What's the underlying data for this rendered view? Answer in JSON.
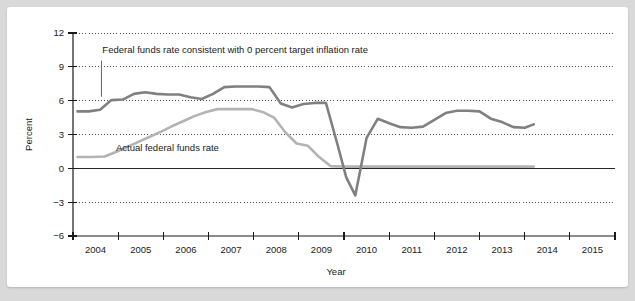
{
  "chart_data": {
    "type": "line",
    "title": "",
    "xlabel": "Year",
    "ylabel": "Percent",
    "xlim": [
      2003.5,
      2015.5
    ],
    "ylim": [
      -6,
      12
    ],
    "yticks": [
      -6,
      -3,
      0,
      3,
      6,
      9,
      12
    ],
    "ytick_labels": [
      "−6",
      "−3",
      "0",
      "3",
      "6",
      "9",
      "12"
    ],
    "xticks": [
      2003.5,
      2004.5,
      2005.5,
      2006.5,
      2007.5,
      2008.5,
      2009.5,
      2010.5,
      2011.5,
      2012.5,
      2013.5,
      2014.5,
      2015.5
    ],
    "xtick_labels": [
      "2004",
      "2005",
      "2006",
      "2007",
      "2008",
      "2009",
      "2010",
      "2011",
      "2012",
      "2013",
      "2014",
      "2015"
    ],
    "grid": "horizontal-dotted",
    "legend_position": "inline-annotations",
    "series": [
      {
        "name": "Federal funds rate consistent with 0 percent target inflation rate",
        "color": "#808080",
        "width": 2.6,
        "x": [
          2003.6,
          2003.85,
          2004.1,
          2004.35,
          2004.6,
          2004.85,
          2005.1,
          2005.35,
          2005.6,
          2005.85,
          2006.1,
          2006.35,
          2006.6,
          2006.85,
          2007.1,
          2007.35,
          2007.6,
          2007.85,
          2008.1,
          2008.35,
          2008.6,
          2008.85,
          2009.1,
          2009.35,
          2009.55,
          2009.75,
          2010.0,
          2010.25,
          2010.5,
          2010.75,
          2011.0,
          2011.25,
          2011.5,
          2011.75,
          2012.0,
          2012.25,
          2012.5,
          2012.75,
          2013.0,
          2013.25,
          2013.5,
          2013.7
        ],
        "y": [
          5.05,
          5.05,
          5.2,
          6.05,
          6.1,
          6.6,
          6.75,
          6.6,
          6.55,
          6.55,
          6.3,
          6.15,
          6.6,
          7.2,
          7.25,
          7.25,
          7.25,
          7.2,
          5.75,
          5.4,
          5.7,
          5.8,
          5.8,
          2.2,
          -0.8,
          -2.4,
          2.7,
          4.4,
          4.0,
          3.65,
          3.6,
          3.7,
          4.3,
          4.9,
          5.1,
          5.1,
          5.05,
          4.4,
          4.1,
          3.65,
          3.6,
          3.9
        ]
      },
      {
        "name": "Actual federal funds rate",
        "color": "#b3b3b3",
        "width": 2.6,
        "x": [
          2003.6,
          2003.9,
          2004.2,
          2004.45,
          2004.7,
          2004.95,
          2005.2,
          2005.45,
          2005.7,
          2005.95,
          2006.2,
          2006.45,
          2006.7,
          2006.95,
          2007.2,
          2007.45,
          2007.7,
          2007.95,
          2008.2,
          2008.45,
          2008.7,
          2008.95,
          2009.2,
          2009.5,
          2010.0,
          2011.0,
          2012.0,
          2013.0,
          2013.7
        ],
        "y": [
          1.0,
          1.0,
          1.05,
          1.45,
          1.9,
          2.35,
          2.8,
          3.25,
          3.75,
          4.2,
          4.65,
          5.0,
          5.25,
          5.25,
          5.25,
          5.25,
          5.0,
          4.5,
          3.2,
          2.2,
          2.0,
          1.0,
          0.2,
          0.15,
          0.15,
          0.15,
          0.15,
          0.15,
          0.15
        ]
      }
    ],
    "zero_line": 0,
    "annotations": [
      {
        "name": "annotation-consistent-rate",
        "text": "Federal funds rate consistent with 0 percent target inflation rate",
        "text_x": 2004.15,
        "text_y": 10.25,
        "leader_x": 2004.13,
        "leader_y_top": 9.55,
        "leader_y_bottom": 6.35
      },
      {
        "name": "annotation-actual-rate",
        "text": "Actual federal funds rate",
        "text_x": 2004.45,
        "text_y": 1.55,
        "leader_x": null,
        "leader_y_top": null,
        "leader_y_bottom": null
      }
    ]
  },
  "colors": {
    "page_background": "#d9d9d9",
    "figure_background": "#ffffff",
    "axis": "#1a1a1a",
    "grid": "#4d4d4d",
    "series_consistent": "#808080",
    "series_actual": "#b3b3b3",
    "text": "#1a1a1a"
  }
}
